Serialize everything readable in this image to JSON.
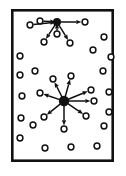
{
  "figure": {
    "type": "diagram",
    "width": 126,
    "height": 176,
    "background_color": "#ffffff"
  },
  "frame": {
    "name": "outer-border-rectangle",
    "x": 11,
    "y": 9,
    "width": 103,
    "height": 153,
    "stroke_color": "#111111",
    "stroke_width": 2.6,
    "fill_color": "#ffffff"
  },
  "style": {
    "node_outer_radius": 2.9,
    "node_inner_radius": 1.1,
    "node_stroke_color": "#111111",
    "node_stroke_width": 1.5,
    "node_fill_color": "#ffffff",
    "edge_color": "#111111",
    "edge_width": 1.5,
    "arrowhead_length": 5.2,
    "arrowhead_width": 4.2,
    "hub_blob_color": "#111111"
  },
  "clusters": [
    {
      "id": "cluster-top",
      "label": "upper star cluster",
      "hub": {
        "id": "hub-top",
        "x": 57,
        "y": 22,
        "blob_radius": 4.0
      },
      "spokes": [
        {
          "id": "top-spoke-w",
          "x": 30,
          "y": 25,
          "direction": "inbound"
        },
        {
          "id": "top-spoke-nw",
          "x": 40,
          "y": 21,
          "direction": "inbound"
        },
        {
          "id": "top-spoke-e",
          "x": 85,
          "y": 22,
          "direction": "outbound"
        },
        {
          "id": "top-spoke-sw",
          "x": 44,
          "y": 42,
          "direction": "outbound"
        },
        {
          "id": "top-spoke-se",
          "x": 70,
          "y": 43,
          "direction": "outbound"
        },
        {
          "id": "top-spoke-s",
          "x": 57,
          "y": 34,
          "direction": "inbound"
        }
      ]
    },
    {
      "id": "cluster-bottom",
      "label": "lower star cluster",
      "hub": {
        "id": "hub-bottom",
        "x": 64,
        "y": 101,
        "blob_radius": 5.2
      },
      "spokes": [
        {
          "id": "bot-spoke-n",
          "x": 71,
          "y": 76,
          "direction": "outbound"
        },
        {
          "id": "bot-spoke-nnw",
          "x": 53,
          "y": 79,
          "direction": "outbound"
        },
        {
          "id": "bot-spoke-ne",
          "x": 91,
          "y": 90,
          "direction": "outbound"
        },
        {
          "id": "bot-spoke-w",
          "x": 40,
          "y": 93,
          "direction": "outbound"
        },
        {
          "id": "bot-spoke-sw",
          "x": 44,
          "y": 117,
          "direction": "outbound"
        },
        {
          "id": "bot-spoke-se",
          "x": 86,
          "y": 116,
          "direction": "outbound"
        },
        {
          "id": "bot-spoke-s",
          "x": 64,
          "y": 129,
          "direction": "outbound"
        },
        {
          "id": "bot-spoke-ene",
          "x": 94,
          "y": 101,
          "direction": "outbound"
        }
      ]
    }
  ],
  "isolated_nodes": [
    {
      "id": "iso-1",
      "x": 104,
      "y": 37
    },
    {
      "id": "iso-2",
      "x": 20,
      "y": 56
    },
    {
      "id": "iso-3",
      "x": 93,
      "y": 50
    },
    {
      "id": "iso-4",
      "x": 111,
      "y": 57
    },
    {
      "id": "iso-5",
      "x": 35,
      "y": 71
    },
    {
      "id": "iso-6",
      "x": 103,
      "y": 71
    },
    {
      "id": "iso-7",
      "x": 20,
      "y": 75
    },
    {
      "id": "iso-8",
      "x": 22,
      "y": 96
    },
    {
      "id": "iso-9",
      "x": 109,
      "y": 92
    },
    {
      "id": "iso-10",
      "x": 21,
      "y": 118
    },
    {
      "id": "iso-11",
      "x": 109,
      "y": 112
    },
    {
      "id": "iso-12",
      "x": 33,
      "y": 125
    },
    {
      "id": "iso-13",
      "x": 104,
      "y": 126
    },
    {
      "id": "iso-14",
      "x": 20,
      "y": 138
    },
    {
      "id": "iso-15",
      "x": 45,
      "y": 148
    },
    {
      "id": "iso-16",
      "x": 71,
      "y": 147
    },
    {
      "id": "iso-17",
      "x": 97,
      "y": 146
    }
  ]
}
